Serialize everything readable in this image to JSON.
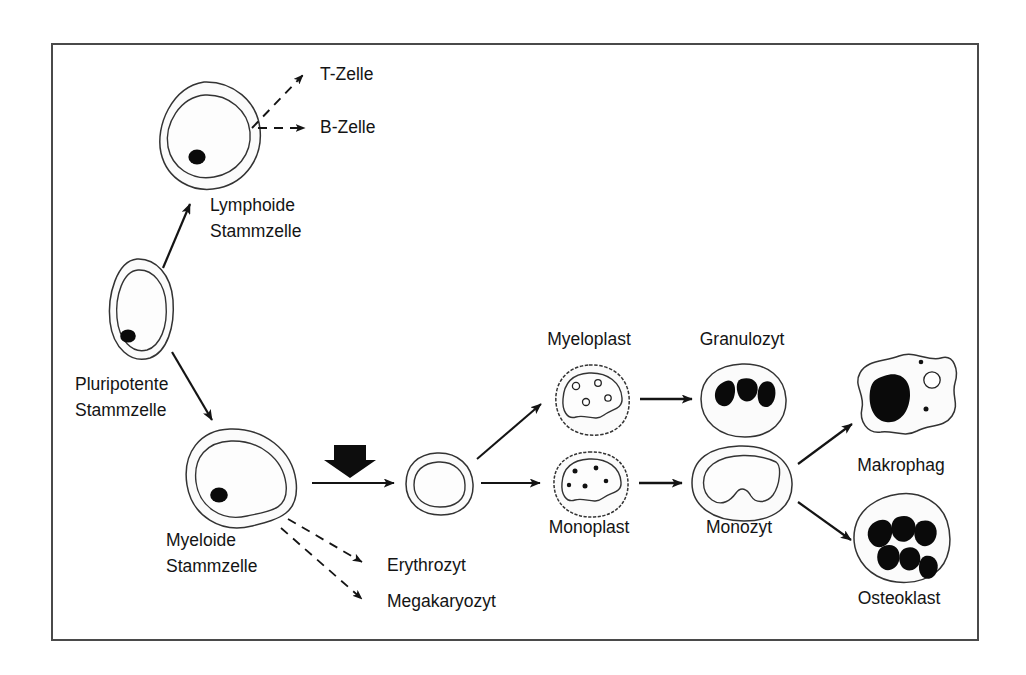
{
  "figure": {
    "language": "de",
    "background_color": "#ffffff",
    "frame": {
      "border_color": "#4a4a4a",
      "x": 52,
      "y": 44,
      "width": 926,
      "height": 596
    },
    "ink_color": "#141414",
    "cell_fill_color": "#fbfbfb",
    "nucleus_color": "#0a0a0a"
  },
  "nodes": [
    {
      "id": "lymphoide-stammzelle",
      "label_lines": [
        "Lymphoide",
        "Stammzelle"
      ],
      "label_x": 210,
      "label_y": 206,
      "cell_x": 204,
      "cell_y": 135,
      "cell_type": "round-stem-cell",
      "has_label": true
    },
    {
      "id": "pluripotente-stammzelle",
      "label_lines": [
        "Pluripotente",
        "Stammzelle"
      ],
      "label_x": 75,
      "label_y": 385,
      "cell_x": 137,
      "cell_y": 310,
      "cell_type": "oval-stem-cell",
      "has_label": true
    },
    {
      "id": "myeloide-stammzelle",
      "label_lines": [
        "Myeloide",
        "Stammzelle"
      ],
      "label_x": 166,
      "label_y": 541,
      "cell_x": 226,
      "cell_y": 478,
      "cell_type": "large-stem-cell",
      "has_label": true
    },
    {
      "id": "progenitor-intermediate",
      "label_lines": [],
      "cell_x": 437,
      "cell_y": 483,
      "cell_type": "small-progenitor",
      "has_label": false
    },
    {
      "id": "myeloplast",
      "label_lines": [
        "Myeloplast"
      ],
      "label_x": 589,
      "label_y": 340,
      "cell_x": 589,
      "cell_y": 399,
      "cell_type": "myeloblast",
      "has_label": true
    },
    {
      "id": "granulozyt",
      "label_lines": [
        "Granulozyt"
      ],
      "label_x": 742,
      "label_y": 340,
      "cell_x": 742,
      "cell_y": 399,
      "cell_type": "granulocyte",
      "has_label": true
    },
    {
      "id": "monoplast",
      "label_lines": [
        "Monoplast"
      ],
      "label_x": 589,
      "label_y": 528,
      "cell_x": 589,
      "cell_y": 483,
      "cell_type": "monoblast",
      "has_label": true
    },
    {
      "id": "monozyt",
      "label_lines": [
        "Monozyt"
      ],
      "label_x": 739,
      "label_y": 528,
      "cell_x": 739,
      "cell_y": 483,
      "cell_type": "monocyte",
      "has_label": true
    },
    {
      "id": "makrophag",
      "label_lines": [
        "Makrophag"
      ],
      "label_x": 901,
      "label_y": 466,
      "cell_x": 901,
      "cell_y": 400,
      "cell_type": "macrophage",
      "has_label": true
    },
    {
      "id": "osteoklast",
      "label_lines": [
        "Osteoklast"
      ],
      "label_x": 899,
      "label_y": 599,
      "cell_x": 899,
      "cell_y": 537,
      "cell_type": "osteoclast",
      "has_label": true
    }
  ],
  "terminal_labels": [
    {
      "id": "t-zelle",
      "text": "T-Zelle",
      "x": 320,
      "y": 75,
      "arrow": "dashed"
    },
    {
      "id": "b-zelle",
      "text": "B-Zelle",
      "x": 320,
      "y": 128,
      "arrow": "dashed"
    },
    {
      "id": "erythrozyt",
      "text": "Erythrozyt",
      "x": 387,
      "y": 566,
      "arrow": "dashed"
    },
    {
      "id": "megakaryozyt",
      "text": "Megakaryozyt",
      "x": 387,
      "y": 602,
      "arrow": "dashed"
    }
  ],
  "edges": [
    {
      "id": "pluripotent-to-lymphoid",
      "from": "pluripotente-stammzelle",
      "to": "lymphoide-stammzelle",
      "style": "solid"
    },
    {
      "id": "pluripotent-to-myeloid",
      "from": "pluripotente-stammzelle",
      "to": "myeloide-stammzelle",
      "style": "solid"
    },
    {
      "id": "lymphoid-to-t-zelle",
      "from": "lymphoide-stammzelle",
      "to": "t-zelle",
      "style": "dashed"
    },
    {
      "id": "lymphoid-to-b-zelle",
      "from": "lymphoide-stammzelle",
      "to": "b-zelle",
      "style": "dashed"
    },
    {
      "id": "myeloid-to-progenitor",
      "from": "myeloide-stammzelle",
      "to": "progenitor-intermediate",
      "style": "solid",
      "annotation": "thick-block-arrow"
    },
    {
      "id": "myeloid-to-erythrozyt",
      "from": "myeloide-stammzelle",
      "to": "erythrozyt",
      "style": "dashed"
    },
    {
      "id": "myeloid-to-megakaryozyt",
      "from": "myeloide-stammzelle",
      "to": "megakaryozyt",
      "style": "dashed"
    },
    {
      "id": "progenitor-to-myeloplast",
      "from": "progenitor-intermediate",
      "to": "myeloplast",
      "style": "solid"
    },
    {
      "id": "progenitor-to-monoplast",
      "from": "progenitor-intermediate",
      "to": "monoplast",
      "style": "solid"
    },
    {
      "id": "myeloplast-to-granulozyt",
      "from": "myeloplast",
      "to": "granulozyt",
      "style": "solid"
    },
    {
      "id": "monoplast-to-monozyt",
      "from": "monoplast",
      "to": "monozyt",
      "style": "solid"
    },
    {
      "id": "monozyt-to-makrophag",
      "from": "monozyt",
      "to": "makrophag",
      "style": "solid"
    },
    {
      "id": "monozyt-to-osteoklast",
      "from": "monozyt",
      "to": "osteoklast",
      "style": "solid"
    }
  ]
}
